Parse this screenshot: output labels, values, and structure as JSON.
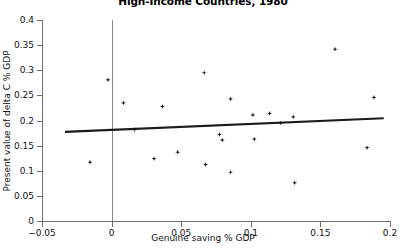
{
  "chart_data": {
    "type": "scatter",
    "title": "High-Income Countries, 1980",
    "xlabel": "Genuine saving % GDP",
    "ylabel": "Present value of delta C % GDP",
    "xlim": [
      -0.05,
      0.2
    ],
    "ylim": [
      0,
      0.4
    ],
    "xticks": [
      "-0.05",
      "0",
      "0.05",
      "0.1",
      "0.15",
      "0.2"
    ],
    "xtick_values": [
      -0.05,
      0,
      0.05,
      0.1,
      0.15,
      0.2
    ],
    "yticks": [
      "0",
      "0.05",
      "0.1",
      "0.15",
      "0.2",
      "0.25",
      "0.3",
      "0.35",
      "0.4"
    ],
    "ytick_values": [
      0,
      0.05,
      0.1,
      0.15,
      0.2,
      0.25,
      0.3,
      0.35,
      0.4
    ],
    "grid": false,
    "legend": false,
    "marker": "diamond-plus",
    "marker_color": "#111111",
    "axis_color": "#6e6e6e",
    "zero_reference_line_x": 0,
    "points": [
      {
        "x": -0.0155,
        "y": 0.117
      },
      {
        "x": -0.0025,
        "y": 0.281
      },
      {
        "x": 0.0085,
        "y": 0.235
      },
      {
        "x": 0.0165,
        "y": 0.182
      },
      {
        "x": 0.0305,
        "y": 0.124
      },
      {
        "x": 0.0365,
        "y": 0.228
      },
      {
        "x": 0.0475,
        "y": 0.137
      },
      {
        "x": 0.0665,
        "y": 0.295
      },
      {
        "x": 0.0675,
        "y": 0.112
      },
      {
        "x": 0.0775,
        "y": 0.172
      },
      {
        "x": 0.0795,
        "y": 0.161
      },
      {
        "x": 0.0855,
        "y": 0.243
      },
      {
        "x": 0.0855,
        "y": 0.097
      },
      {
        "x": 0.1015,
        "y": 0.211
      },
      {
        "x": 0.1025,
        "y": 0.163
      },
      {
        "x": 0.1135,
        "y": 0.214
      },
      {
        "x": 0.1215,
        "y": 0.195
      },
      {
        "x": 0.1305,
        "y": 0.207
      },
      {
        "x": 0.1315,
        "y": 0.076
      },
      {
        "x": 0.1605,
        "y": 0.342
      },
      {
        "x": 0.1835,
        "y": 0.146
      },
      {
        "x": 0.1885,
        "y": 0.246
      }
    ],
    "trendline": {
      "x_start": -0.0335,
      "y_start": 0.1775,
      "x_end": 0.1955,
      "y_end": 0.2045,
      "color": "#1a1a1a"
    }
  }
}
